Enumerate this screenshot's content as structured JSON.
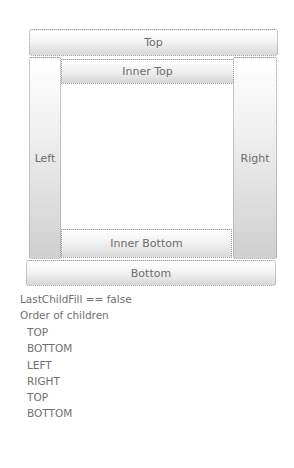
{
  "dock_panel": {
    "top": "Top",
    "inner_top": "Inner Top",
    "left": "Left",
    "right": "Right",
    "inner_bottom": "Inner Bottom",
    "bottom": "Bottom"
  },
  "info": {
    "last_child_fill": "LastChildFill == false",
    "order_heading": "Order of children",
    "children": [
      "TOP",
      "BOTTOM",
      "LEFT",
      "RIGHT",
      "TOP",
      "BOTTOM"
    ]
  },
  "colors": {
    "border": "#9a9a9a",
    "text": "#6d6d6d",
    "background": "#ffffff"
  }
}
